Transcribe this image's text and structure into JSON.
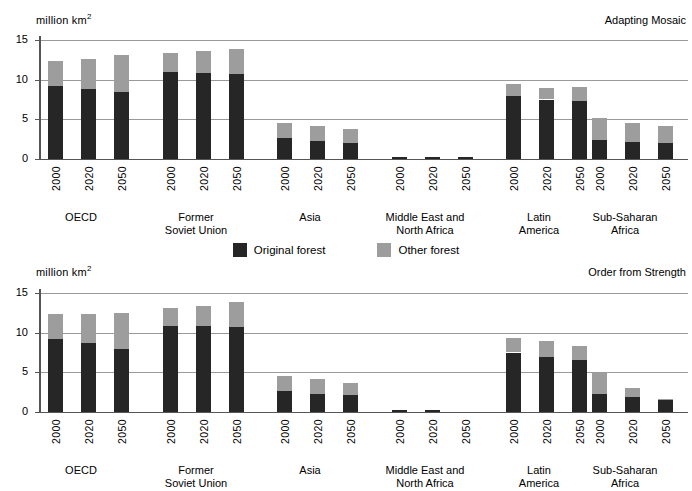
{
  "legend": {
    "entries": [
      {
        "label": "Original forest",
        "color": "#262626",
        "key": "original"
      },
      {
        "label": "Other forest",
        "color": "#9d9d9d",
        "key": "other"
      }
    ]
  },
  "axis": {
    "units": "million  km",
    "units_superscript": "2",
    "yticks": [
      "15",
      "10",
      "5",
      "0"
    ]
  },
  "groups": [
    {
      "label": "OECD"
    },
    {
      "label": "Former\nSoviet Union"
    },
    {
      "label": "Asia"
    },
    {
      "label": "Middle East and\nNorth Africa"
    },
    {
      "label": "Latin\nAmerica"
    },
    {
      "label": "Sub-Saharan\nAfrica"
    }
  ],
  "years": [
    "2000",
    "2020",
    "2050"
  ],
  "panels": [
    {
      "id": "top",
      "title": "Adapting Mosaic"
    },
    {
      "id": "bottom",
      "title": "Order from Strength"
    }
  ],
  "chart_data": [
    {
      "type": "bar",
      "title": "Adapting Mosaic",
      "subtitle": "",
      "xlabel": "",
      "ylabel": "million km2",
      "ylim": [
        0,
        15
      ],
      "yticks": [
        0,
        5,
        10,
        15
      ],
      "grid": true,
      "stacked": true,
      "legend_position": "below-chart-center",
      "categories": [
        "OECD 2000",
        "OECD 2020",
        "OECD 2050",
        "Former Soviet Union 2000",
        "Former Soviet Union 2020",
        "Former Soviet Union 2050",
        "Asia 2000",
        "Asia 2020",
        "Asia 2050",
        "Middle East and North Africa 2000",
        "Middle East and North Africa 2020",
        "Middle East and North Africa 2050",
        "Latin America 2000",
        "Latin America 2020",
        "Latin America 2050",
        "Sub-Saharan Africa 2000",
        "Sub-Saharan Africa 2020",
        "Sub-Saharan Africa 2050"
      ],
      "series": [
        {
          "name": "Original forest",
          "color": "#262626",
          "values": [
            9.2,
            8.8,
            8.4,
            11.0,
            10.8,
            10.7,
            2.7,
            2.3,
            2.0,
            0.2,
            0.2,
            0.2,
            8.0,
            7.5,
            7.3,
            2.4,
            2.1,
            2.0
          ]
        },
        {
          "name": "Other forest",
          "color": "#9d9d9d",
          "values": [
            3.1,
            3.8,
            4.7,
            2.3,
            2.8,
            3.2,
            1.8,
            1.9,
            1.8,
            0.0,
            0.0,
            0.0,
            1.5,
            1.5,
            1.8,
            2.8,
            2.5,
            2.2
          ]
        }
      ],
      "totals": [
        12.3,
        12.6,
        13.1,
        13.3,
        13.6,
        13.9,
        4.5,
        4.2,
        3.8,
        0.2,
        0.2,
        0.2,
        9.5,
        9.0,
        9.1,
        5.2,
        4.6,
        4.2
      ]
    },
    {
      "type": "bar",
      "title": "Order from Strength",
      "subtitle": "",
      "xlabel": "",
      "ylabel": "million km2",
      "ylim": [
        0,
        15
      ],
      "yticks": [
        0,
        5,
        10,
        15
      ],
      "grid": true,
      "stacked": true,
      "legend_position": "above-chart-center",
      "categories": [
        "OECD 2000",
        "OECD 2020",
        "OECD 2050",
        "Former Soviet Union 2000",
        "Former Soviet Union 2020",
        "Former Soviet Union 2050",
        "Asia 2000",
        "Asia 2020",
        "Asia 2050",
        "Middle East and North Africa 2000",
        "Middle East and North Africa 2020",
        "Middle East and North Africa 2050",
        "Latin America 2000",
        "Latin America 2020",
        "Latin America 2050",
        "Sub-Saharan Africa 2000",
        "Sub-Saharan Africa 2020",
        "Sub-Saharan Africa 2050"
      ],
      "series": [
        {
          "name": "Original forest",
          "color": "#262626",
          "values": [
            9.2,
            8.7,
            8.0,
            10.9,
            10.8,
            10.7,
            2.6,
            2.3,
            2.1,
            0.2,
            0.2,
            0.0,
            7.5,
            6.9,
            6.6,
            2.3,
            1.9,
            1.5
          ]
        },
        {
          "name": "Other forest",
          "color": "#9d9d9d",
          "values": [
            3.1,
            3.6,
            4.5,
            2.2,
            2.6,
            3.2,
            1.9,
            1.8,
            1.6,
            0.0,
            0.0,
            0.0,
            1.8,
            2.0,
            1.7,
            2.6,
            1.1,
            0.2
          ]
        }
      ],
      "totals": [
        12.3,
        12.3,
        12.5,
        13.1,
        13.4,
        13.9,
        4.5,
        4.1,
        3.7,
        0.2,
        0.2,
        0.0,
        9.3,
        8.9,
        8.3,
        4.9,
        3.0,
        1.7
      ]
    }
  ]
}
